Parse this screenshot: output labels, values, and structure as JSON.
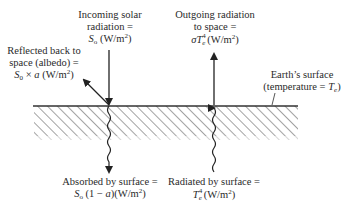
{
  "diagram": {
    "type": "earth-energy-balance",
    "surface": {
      "label_line1": "Earth’s surface",
      "label_line2_prefix": "(temperature = ",
      "label_line2_var": "T",
      "label_line2_sub": "e",
      "label_line2_suffix": ")"
    },
    "incoming": {
      "line1": "Incoming solar",
      "line2": "radiation =",
      "line3_var": "S",
      "line3_sub": "o",
      "line3_unit": " (W/m",
      "line3_sup": "2",
      "line3_close": ")"
    },
    "reflected": {
      "line1": "Reflected back to",
      "line2": "space (albedo) =",
      "line3_var": "S",
      "line3_sub": "0",
      "line3_op": " × ",
      "line3_a": "a",
      "line3_unit": " (W/m",
      "line3_sup": "2",
      "line3_close": ")"
    },
    "outgoing": {
      "line1": "Outgoing radiation",
      "line2": "to space =",
      "line3_sigma": "σ",
      "line3_var": "T",
      "line3_sup": "4",
      "line3_sub": "e",
      "line3_unit": "(W/m",
      "line3_sup2": "2",
      "line3_close": ")"
    },
    "absorbed": {
      "line1": "Absorbed by surface =",
      "line2_var": "S",
      "line2_sub": "o",
      "line2_expr_open": " (1 − ",
      "line2_a": "a",
      "line2_expr_close": ")",
      "line2_unit": "(W/m",
      "line2_sup": "2",
      "line2_close": ")"
    },
    "radiated": {
      "line1": "Radiated by surface =",
      "line2_var": "T",
      "line2_sup": "4",
      "line2_sub": "e",
      "line2_unit": "(W/m",
      "line2_sup2": "2",
      "line2_close": ")"
    },
    "colors": {
      "line": "#222222",
      "hatch": "#555555"
    }
  }
}
